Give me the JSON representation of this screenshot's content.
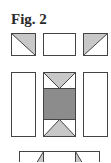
{
  "figure": {
    "title": "Fig. 2"
  },
  "colors": {
    "outline": "#444444",
    "light_fill": "#c8c8c8",
    "dark_fill": "#8c8c8c",
    "blank_fill": "#ffffff"
  },
  "rows": [
    {
      "name": "top-row",
      "pieces": [
        {
          "name": "half-square-triangle-left",
          "type": "hst",
          "shaded": "upper-right",
          "diagonal": "top-left-to-bottom-right"
        },
        {
          "name": "plain-rectangle",
          "type": "plain"
        },
        {
          "name": "half-square-triangle-right",
          "type": "hst",
          "shaded": "upper-left",
          "diagonal": "bottom-left-to-top-right"
        }
      ]
    },
    {
      "name": "middle-row",
      "pieces": [
        {
          "name": "plain-tall-rectangle-left",
          "type": "plain"
        },
        {
          "name": "center-block",
          "type": "flying-geese-center",
          "top_triangle": "light",
          "center": "dark",
          "bottom_triangle": "light"
        },
        {
          "name": "plain-tall-rectangle-right",
          "type": "plain"
        }
      ]
    },
    {
      "name": "bottom-row",
      "pieces": [
        {
          "name": "bottom-strip",
          "type": "partial",
          "note": "cut off at image edge"
        }
      ]
    }
  ]
}
